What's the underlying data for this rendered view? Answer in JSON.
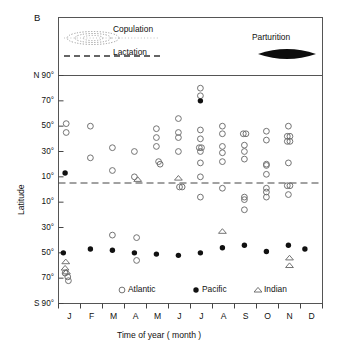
{
  "figure": {
    "panel_label": "B"
  },
  "annotations": {
    "copulation": {
      "label": "Copulation",
      "marker": "dotted-lens"
    },
    "lactation": {
      "label": "Lactation",
      "marker": "dashed-line"
    },
    "parturition": {
      "label": "Parturition",
      "marker": "solid-lens"
    }
  },
  "legend": {
    "position": "bottom-inside",
    "entries": [
      {
        "label": "Atlantic",
        "marker": "open-circle"
      },
      {
        "label": "Pacific",
        "marker": "filled-circle"
      },
      {
        "label": "Indian",
        "marker": "open-triangle"
      }
    ]
  },
  "chart_data": {
    "type": "scatter",
    "title": "",
    "subtitle": "",
    "xlabel": "Time of year ( month )",
    "ylabel": "Latitude",
    "grid": false,
    "xlim": [
      0,
      12
    ],
    "ylim": [
      -90,
      90
    ],
    "equator_line": {
      "value": 0,
      "style": "dashed"
    },
    "x_categories": [
      "J",
      "F",
      "M",
      "A",
      "M",
      "J",
      "J",
      "A",
      "S",
      "O",
      "N",
      "D"
    ],
    "x_tick_labels": [
      "J",
      "F",
      "M",
      "A",
      "M",
      "J",
      "J",
      "A",
      "S",
      "O",
      "N",
      "D"
    ],
    "y_tick_values": [
      90,
      70,
      50,
      30,
      10,
      -10,
      -30,
      -50,
      -70,
      -90
    ],
    "y_tick_labels": [
      "N 90°",
      "70°",
      "50°",
      "30°",
      "10°",
      "10°",
      "30°",
      "50°",
      "70°",
      "S 90°"
    ],
    "series": [
      {
        "name": "Atlantic",
        "marker": "open-circle",
        "points": [
          [
            0.35,
            52
          ],
          [
            0.35,
            45
          ],
          [
            0.3,
            -66
          ],
          [
            0.42,
            -69
          ],
          [
            0.45,
            -72
          ],
          [
            1.45,
            50
          ],
          [
            1.45,
            25
          ],
          [
            2.45,
            33
          ],
          [
            2.45,
            15
          ],
          [
            2.45,
            -36
          ],
          [
            3.45,
            30
          ],
          [
            3.45,
            10
          ],
          [
            3.55,
            -38
          ],
          [
            3.55,
            -56
          ],
          [
            4.45,
            48
          ],
          [
            4.45,
            41
          ],
          [
            4.45,
            34
          ],
          [
            4.55,
            22
          ],
          [
            4.62,
            20
          ],
          [
            5.45,
            56
          ],
          [
            5.45,
            45
          ],
          [
            5.45,
            41
          ],
          [
            5.45,
            30
          ],
          [
            5.5,
            2
          ],
          [
            5.62,
            2
          ],
          [
            6.45,
            80
          ],
          [
            6.45,
            74
          ],
          [
            6.45,
            47
          ],
          [
            6.45,
            40
          ],
          [
            6.4,
            33
          ],
          [
            6.5,
            33
          ],
          [
            6.45,
            30
          ],
          [
            6.45,
            21
          ],
          [
            6.45,
            10
          ],
          [
            6.45,
            -6
          ],
          [
            7.45,
            50
          ],
          [
            7.45,
            44
          ],
          [
            7.45,
            34
          ],
          [
            7.45,
            29
          ],
          [
            7.45,
            22
          ],
          [
            7.45,
            1
          ],
          [
            8.4,
            44
          ],
          [
            8.52,
            44
          ],
          [
            8.45,
            35
          ],
          [
            8.45,
            30
          ],
          [
            8.45,
            24
          ],
          [
            8.45,
            -6
          ],
          [
            8.45,
            -8
          ],
          [
            8.45,
            -16
          ],
          [
            9.45,
            46
          ],
          [
            9.45,
            39
          ],
          [
            9.45,
            20
          ],
          [
            9.45,
            19
          ],
          [
            9.45,
            12
          ],
          [
            9.45,
            1
          ],
          [
            9.45,
            -2
          ],
          [
            9.45,
            -6
          ],
          [
            10.45,
            50
          ],
          [
            10.4,
            42
          ],
          [
            10.52,
            42
          ],
          [
            10.4,
            38
          ],
          [
            10.52,
            38
          ],
          [
            10.45,
            21
          ],
          [
            10.4,
            3
          ],
          [
            10.52,
            3
          ],
          [
            10.45,
            -4
          ]
        ]
      },
      {
        "name": "Pacific",
        "marker": "filled-circle",
        "points": [
          [
            0.3,
            13
          ],
          [
            0.22,
            -50
          ],
          [
            1.45,
            -47
          ],
          [
            2.45,
            -48
          ],
          [
            3.45,
            -50
          ],
          [
            4.45,
            -51
          ],
          [
            5.45,
            -52
          ],
          [
            6.45,
            70
          ],
          [
            6.45,
            -50
          ],
          [
            7.45,
            -46
          ],
          [
            8.45,
            -44
          ],
          [
            9.45,
            -49
          ],
          [
            10.45,
            -44
          ],
          [
            11.2,
            -47
          ]
        ]
      },
      {
        "name": "Indian",
        "marker": "open-triangle",
        "points": [
          [
            0.33,
            -57
          ],
          [
            0.3,
            -62
          ],
          [
            0.36,
            -65
          ],
          [
            3.6,
            8
          ],
          [
            5.45,
            9
          ],
          [
            7.45,
            -33
          ],
          [
            10.5,
            -54
          ],
          [
            10.5,
            -60
          ]
        ]
      }
    ]
  }
}
